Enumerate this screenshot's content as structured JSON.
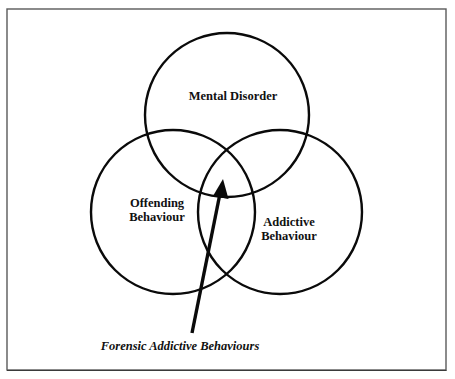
{
  "diagram": {
    "type": "venn",
    "frame": {
      "x": 7,
      "y": 9,
      "width": 439,
      "height": 361,
      "color": "#5a5a5a"
    },
    "sets": [
      {
        "id": "mental-disorder",
        "label_lines": [
          "Mental Disorder"
        ],
        "circle": {
          "cx": 227,
          "cy": 115,
          "r": 82
        }
      },
      {
        "id": "offending-behaviour",
        "label_lines": [
          "Offending",
          "Behaviour"
        ],
        "circle": {
          "cx": 173,
          "cy": 212,
          "r": 82
        }
      },
      {
        "id": "addictive-behaviour",
        "label_lines": [
          "Addictive",
          "Behaviour"
        ],
        "circle": {
          "cx": 280,
          "cy": 212,
          "r": 82
        }
      }
    ],
    "labels": {
      "mental_disorder": "Mental Disorder",
      "offending_line1": "Offending",
      "offending_line2": "Behaviour",
      "addictive_line1": "Addictive",
      "addictive_line2": "Behaviour"
    },
    "intersection_annotation": {
      "text": "Forensic Addictive Behaviours",
      "points_to": "intersection of all three sets",
      "arrow": {
        "from": [
          192,
          333
        ],
        "to": [
          223,
          180
        ]
      }
    },
    "colors": {
      "stroke": "#0a0a0a",
      "text": "#111111",
      "background": "#ffffff"
    }
  }
}
